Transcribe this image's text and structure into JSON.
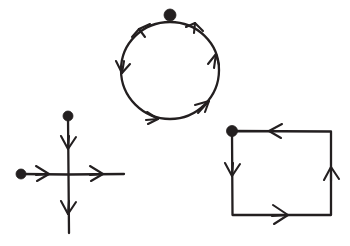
{
  "figure": {
    "title": "Three oriented curves with direction arrows",
    "background_color": "#ffffff",
    "ink_color": "#231f20",
    "width": 350,
    "height": 246,
    "shapes": [
      {
        "id": "circle-curve",
        "label": "circle",
        "type": "closed-circle",
        "orientation": "counterclockwise",
        "center": [
          170,
          70
        ],
        "radius": 48,
        "start_point": [
          170,
          22
        ],
        "marker_count": 1,
        "arrow_count": 5,
        "arrows": [
          {
            "label": "top-left arrow",
            "at": [
              142,
              27
            ],
            "angle": 215
          },
          {
            "label": "top-right arrow",
            "at": [
              196,
              26
            ],
            "angle": 200
          },
          {
            "label": "right arrow",
            "at": [
              216,
              57
            ],
            "angle": 290
          },
          {
            "label": "bottom-right arrow",
            "at": [
              206,
              108
            ],
            "angle": 325
          },
          {
            "label": "bottom-left arrow",
            "at": [
              152,
              121
            ],
            "angle": 15
          },
          {
            "label": "left arrow",
            "at": [
              123,
              68
            ],
            "angle": 100
          }
        ]
      },
      {
        "id": "cross-curve",
        "label": "cross",
        "type": "two-crossing-segments",
        "orientation": "down-and-right",
        "center": [
          68,
          174
        ],
        "vertical_segment": {
          "from": [
            68,
            116
          ],
          "to": [
            68,
            233
          ]
        },
        "horizontal_segment": {
          "from": [
            21,
            174
          ],
          "to": [
            124,
            174
          ]
        },
        "marker_count": 2,
        "arrow_count": 4,
        "arrows": [
          {
            "label": "upper vertical arrow",
            "at": [
              68,
              143
            ],
            "angle": 90
          },
          {
            "label": "lower vertical arrow",
            "at": [
              68,
              208
            ],
            "angle": 90
          },
          {
            "label": "left horizontal arrow",
            "at": [
              41,
              174
            ],
            "angle": 0
          },
          {
            "label": "right horizontal arrow",
            "at": [
              95,
              174
            ],
            "angle": 0
          }
        ]
      },
      {
        "id": "square-curve",
        "label": "square",
        "type": "closed-square",
        "orientation": "counterclockwise",
        "top_left": [
          232,
          131
        ],
        "bottom_right": [
          331,
          215
        ],
        "start_point": [
          232,
          131
        ],
        "marker_count": 1,
        "arrow_count": 4,
        "arrows": [
          {
            "label": "top edge arrow",
            "at": [
              272,
              131
            ],
            "angle": 180
          },
          {
            "label": "left edge arrow",
            "at": [
              232,
              171
            ],
            "angle": 90
          },
          {
            "label": "bottom edge arrow",
            "at": [
              282,
              215
            ],
            "angle": 0
          },
          {
            "label": "right edge arrow",
            "at": [
              331,
              174
            ],
            "angle": 270
          }
        ]
      }
    ],
    "markers": [
      {
        "id": "circle-start-dot",
        "label": "circle start point",
        "cx": 170,
        "cy": 15,
        "r": 6
      },
      {
        "id": "cross-top-dot",
        "label": "cross vertical start point",
        "cx": 68,
        "cy": 116,
        "r": 5
      },
      {
        "id": "cross-left-dot",
        "label": "cross horizontal start point",
        "cx": 21,
        "cy": 174,
        "r": 5
      },
      {
        "id": "square-start-dot",
        "label": "square start point",
        "cx": 232,
        "cy": 131,
        "r": 5.5
      }
    ]
  }
}
